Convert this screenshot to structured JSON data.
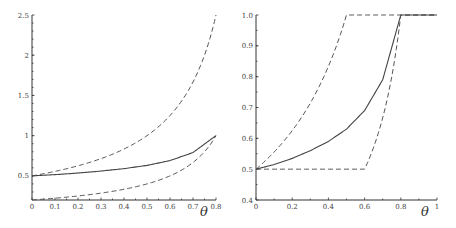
{
  "chart_data": [
    {
      "type": "line",
      "title": "",
      "xlabel": "θ",
      "ylabel": "",
      "xlim": [
        0,
        0.8
      ],
      "ylim": [
        0.2,
        2.5
      ],
      "x_ticks": [
        "0",
        "0.1",
        "0.2",
        "0.3",
        "0.4",
        "0.5",
        "0.6",
        "0.7",
        "0.8"
      ],
      "y_ticks": [
        "0.5",
        "1",
        "1.5",
        "2",
        "2.5"
      ],
      "grid": false,
      "x": [
        0,
        0.1,
        0.2,
        0.3,
        0.4,
        0.5,
        0.6,
        0.7,
        0.8
      ],
      "series": [
        {
          "name": "upper bound (dashed)",
          "style": "dashed",
          "values": [
            0.5,
            0.556,
            0.625,
            0.714,
            0.833,
            1.0,
            1.25,
            1.667,
            2.5
          ]
        },
        {
          "name": "central (solid)",
          "style": "solid",
          "values": [
            0.5,
            0.515,
            0.535,
            0.56,
            0.59,
            0.63,
            0.69,
            0.79,
            1.0
          ]
        },
        {
          "name": "lower bound (dashed)",
          "style": "dashed",
          "values": [
            0.2,
            0.222,
            0.25,
            0.286,
            0.333,
            0.4,
            0.5,
            0.667,
            1.0
          ]
        }
      ]
    },
    {
      "type": "line",
      "title": "",
      "xlabel": "θ",
      "ylabel": "",
      "xlim": [
        0,
        1
      ],
      "ylim": [
        0.4,
        1.0
      ],
      "x_ticks": [
        "0",
        "0.2",
        "0.4",
        "0.6",
        "0.8",
        "1"
      ],
      "y_ticks": [
        "0.4",
        "0.5",
        "0.6",
        "0.7",
        "0.8",
        "0.9",
        "1.0"
      ],
      "grid": false,
      "x": [
        0,
        0.1,
        0.2,
        0.3,
        0.4,
        0.5,
        0.6,
        0.7,
        0.8,
        0.9,
        1.0
      ],
      "series": [
        {
          "name": "upper bound (dashed)",
          "style": "dashed",
          "values": [
            0.5,
            0.556,
            0.625,
            0.714,
            0.833,
            1.0,
            1.0,
            1.0,
            1.0,
            1.0,
            1.0
          ]
        },
        {
          "name": "central (solid)",
          "style": "solid",
          "values": [
            0.5,
            0.515,
            0.535,
            0.56,
            0.59,
            0.63,
            0.69,
            0.79,
            1.0,
            1.0,
            1.0
          ]
        },
        {
          "name": "lower bound (dashed)",
          "style": "dashed",
          "values": [
            0.5,
            0.5,
            0.5,
            0.5,
            0.5,
            0.5,
            0.5,
            0.667,
            1.0,
            1.0,
            1.0
          ]
        }
      ]
    }
  ]
}
